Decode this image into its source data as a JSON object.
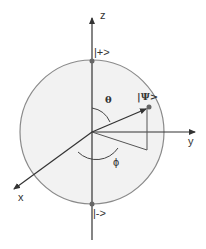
{
  "diagram": {
    "type": "bloch-sphere",
    "colors": {
      "sphere_fill": "#f2f2f2",
      "sphere_stroke": "#8a8a8a",
      "axis": "#333333",
      "text": "#333333"
    },
    "axes": {
      "z_label": "z",
      "y_label": "y",
      "x_label": "x"
    },
    "states": {
      "plus_label": "|+>",
      "minus_label": "|->",
      "psi_label": "|Ψ>"
    },
    "angles": {
      "theta_label": "θ",
      "phi_label": "ϕ"
    }
  }
}
